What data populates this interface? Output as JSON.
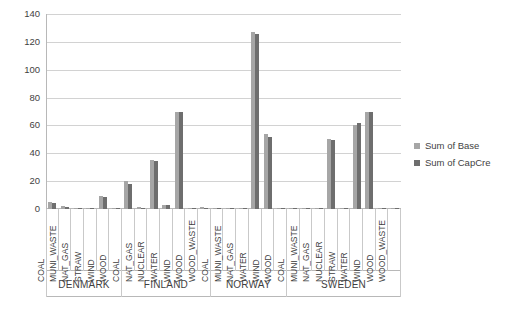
{
  "chart_data": {
    "type": "bar",
    "title": "",
    "subtitle": "",
    "xlabel": "",
    "ylabel": "",
    "ylim": [
      0,
      140
    ],
    "yticks": [
      0,
      20,
      40,
      60,
      80,
      100,
      120,
      140
    ],
    "grid": true,
    "legend_position": "right",
    "series": [
      {
        "name": "Sum of Base",
        "color": "#a6a6a6"
      },
      {
        "name": "Sum of CapCre",
        "color": "#6e6e6e"
      }
    ],
    "groups": [
      {
        "name": "DENMARK",
        "categories": [
          "COAL",
          "MUNI_WASTE",
          "NAT_GAS",
          "STRAW",
          "WIND",
          "WOOD"
        ],
        "values": {
          "Sum of Base": [
            5.0,
            2.0,
            0.6,
            0.4,
            9.0,
            0.6
          ],
          "Sum of CapCre": [
            4.5,
            1.8,
            0.5,
            0.3,
            8.8,
            0.5
          ]
        }
      },
      {
        "name": "FINLAND",
        "categories": [
          "COAL",
          "NAT_GAS",
          "NUCLEAR",
          "WATER",
          "WIND",
          "WOOD",
          "WOOD_WASTE"
        ],
        "values": {
          "Sum of Base": [
            20.0,
            1.2,
            35.0,
            3.0,
            70.0,
            1.0,
            1.2
          ],
          "Sum of CapCre": [
            18.0,
            1.0,
            34.5,
            2.8,
            69.5,
            0.8,
            1.0
          ]
        }
      },
      {
        "name": "NORWAY",
        "categories": [
          "COAL",
          "MUNI_WASTE",
          "NAT_GAS",
          "WATER",
          "WIND",
          "WOOD"
        ],
        "values": {
          "Sum of Base": [
            0.4,
            0.6,
            0.5,
            127.0,
            54.0,
            0.4
          ],
          "Sum of CapCre": [
            0.3,
            0.5,
            0.4,
            126.0,
            52.0,
            0.3
          ]
        }
      },
      {
        "name": "SWEDEN",
        "categories": [
          "COAL",
          "MUNI_WASTE",
          "NAT_GAS",
          "NUCLEAR",
          "STRAW",
          "WATER",
          "WIND",
          "WOOD",
          "WOOD_WASTE"
        ],
        "values": {
          "Sum of Base": [
            0.5,
            0.8,
            0.5,
            50.0,
            0.5,
            60.0,
            70.0,
            0.5,
            0.5
          ],
          "Sum of CapCre": [
            0.4,
            0.6,
            0.4,
            49.5,
            0.4,
            62.0,
            69.5,
            0.4,
            0.4
          ]
        }
      }
    ]
  },
  "legend": {
    "items": [
      {
        "label": "Sum of Base",
        "color": "#a6a6a6"
      },
      {
        "label": "Sum of CapCre",
        "color": "#6e6e6e"
      }
    ]
  },
  "axis": {
    "y_labels": [
      "140",
      "120",
      "100",
      "80",
      "60",
      "40",
      "20",
      "0"
    ]
  }
}
